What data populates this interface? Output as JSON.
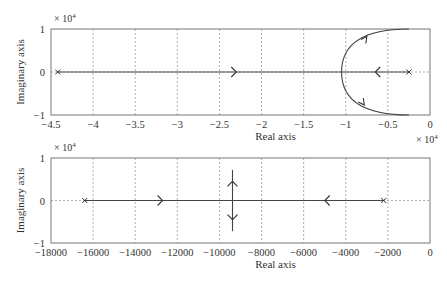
{
  "chart_data": [
    {
      "type": "line",
      "subtype": "root-locus",
      "title": "",
      "xlabel": "Real axis",
      "ylabel": "Imaginary axis",
      "x_multiplier": "× 10^4",
      "y_multiplier": "× 10^4",
      "xlim": [
        -4.5,
        0
      ],
      "ylim": [
        -1,
        1
      ],
      "x_ticks": [
        -4.5,
        -4,
        -3.5,
        -3,
        -2.5,
        -2,
        -1.5,
        -1,
        -0.5,
        0
      ],
      "x_tick_labels": [
        "-4.5",
        "-4",
        "-3.5",
        "-3",
        "-2.5",
        "-2",
        "-1.5",
        "-1",
        "-0.5",
        "0"
      ],
      "y_ticks": [
        -1,
        0,
        1
      ],
      "y_tick_labels": [
        "-1",
        "0",
        "1"
      ],
      "grid": true,
      "poles": [
        [
          -4.42,
          0
        ],
        [
          -0.25,
          0
        ]
      ],
      "branches": [
        {
          "name": "real-axis branch from left pole",
          "points": [
            [
              -4.42,
              0
            ],
            [
              -1.05,
              0
            ]
          ],
          "arrow_at": [
            -2.3,
            0
          ],
          "direction": "right"
        },
        {
          "name": "real-axis branch from right pole",
          "points": [
            [
              -0.25,
              0
            ],
            [
              -1.05,
              0
            ]
          ],
          "arrow_at": [
            -0.65,
            0
          ],
          "direction": "left"
        },
        {
          "name": "upper complex branch",
          "points": [
            [
              -1.05,
              0
            ],
            [
              -1.0,
              0.35
            ],
            [
              -0.75,
              0.78
            ],
            [
              -0.25,
              1.0
            ]
          ],
          "arrow_at": [
            -0.75,
            0.78
          ],
          "direction": "up-right"
        },
        {
          "name": "lower complex branch",
          "points": [
            [
              -1.05,
              0
            ],
            [
              -1.0,
              -0.35
            ],
            [
              -0.75,
              -0.78
            ],
            [
              -0.25,
              -1.0
            ]
          ],
          "arrow_at": [
            -0.78,
            -0.72
          ],
          "direction": "down-right"
        }
      ]
    },
    {
      "type": "line",
      "subtype": "root-locus",
      "title": "",
      "xlabel": "Real axis",
      "ylabel": "Imaginary axis",
      "y_multiplier": "× 10^4",
      "xlim": [
        -18000,
        0
      ],
      "ylim": [
        -1,
        1
      ],
      "x_ticks": [
        -18000,
        -16000,
        -14000,
        -12000,
        -10000,
        -8000,
        -6000,
        -4000,
        -2000,
        0
      ],
      "x_tick_labels": [
        "-18000",
        "-16000",
        "-14000",
        "-12000",
        "-10000",
        "-8000",
        "-6000",
        "-4000",
        "-2000",
        "0"
      ],
      "y_ticks": [
        -1,
        0,
        1
      ],
      "y_tick_labels": [
        "-1",
        "0",
        "1"
      ],
      "grid": true,
      "poles": [
        [
          -16400,
          0
        ],
        [
          -2200,
          0
        ]
      ],
      "branches": [
        {
          "name": "real-axis branch from left pole",
          "points": [
            [
              -16400,
              0
            ],
            [
              -9380,
              0
            ]
          ],
          "arrow_at": [
            -12700,
            0
          ],
          "direction": "right"
        },
        {
          "name": "real-axis branch from right pole",
          "points": [
            [
              -2200,
              0
            ],
            [
              -9380,
              0
            ]
          ],
          "arrow_at": [
            -5000,
            0
          ],
          "direction": "left"
        },
        {
          "name": "upper vertical branch",
          "points": [
            [
              -9380,
              0
            ],
            [
              -9380,
              0.72
            ]
          ],
          "arrow_at": [
            -9380,
            0.45
          ],
          "direction": "up"
        },
        {
          "name": "lower vertical branch",
          "points": [
            [
              -9380,
              0
            ],
            [
              -9380,
              -0.72
            ]
          ],
          "arrow_at": [
            -9380,
            -0.45
          ],
          "direction": "down"
        }
      ]
    }
  ],
  "labels": {
    "top_xlabel": "Real axis",
    "top_ylabel": "Imaginary axis",
    "top_y_mult": "× 10",
    "top_x_mult": "× 10",
    "exp": "4",
    "bottom_xlabel": "Real axis",
    "bottom_ylabel": "Imaginary axis",
    "bottom_y_mult": "× 10"
  }
}
